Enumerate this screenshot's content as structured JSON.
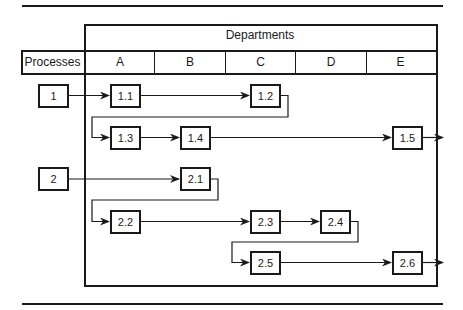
{
  "diagram": {
    "header": {
      "title": "Departments",
      "row_label": "Processes",
      "departments": [
        "A",
        "B",
        "C",
        "D",
        "E"
      ]
    },
    "processes": [
      {
        "label": "1",
        "steps": [
          {
            "label": "1.1",
            "department": "A"
          },
          {
            "label": "1.2",
            "department": "C"
          },
          {
            "label": "1.3",
            "department": "A"
          },
          {
            "label": "1.4",
            "department": "B"
          },
          {
            "label": "1.5",
            "department": "E"
          }
        ]
      },
      {
        "label": "2",
        "steps": [
          {
            "label": "2.1",
            "department": "B"
          },
          {
            "label": "2.2",
            "department": "A"
          },
          {
            "label": "2.3",
            "department": "C"
          },
          {
            "label": "2.4",
            "department": "D"
          },
          {
            "label": "2.5",
            "department": "C"
          },
          {
            "label": "2.6",
            "department": "E"
          }
        ]
      }
    ],
    "flows": [
      [
        "1",
        "1.1"
      ],
      [
        "1.1",
        "1.2"
      ],
      [
        "1.2",
        "1.3"
      ],
      [
        "1.3",
        "1.4"
      ],
      [
        "1.4",
        "1.5"
      ],
      [
        "1.5",
        "exit"
      ],
      [
        "2",
        "2.1"
      ],
      [
        "2.1",
        "2.2"
      ],
      [
        "2.2",
        "2.3"
      ],
      [
        "2.3",
        "2.4"
      ],
      [
        "2.4",
        "2.5"
      ],
      [
        "2.5",
        "2.6"
      ],
      [
        "2.6",
        "exit"
      ]
    ]
  }
}
